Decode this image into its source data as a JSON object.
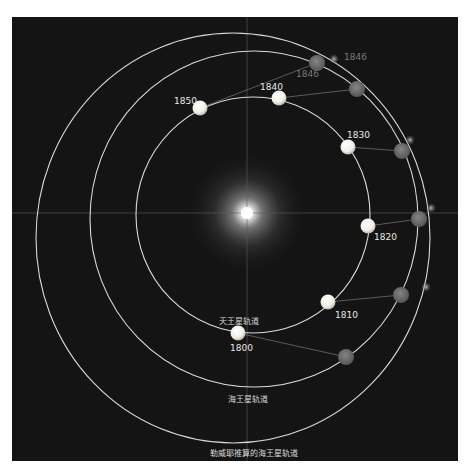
{
  "diagram": {
    "orbit_labels": {
      "uranus": "天王星轨道",
      "neptune": "海王星轨道",
      "leverrier": "勒威耶推算的海王星轨道"
    },
    "uranus_years": [
      "1800",
      "1810",
      "1820",
      "1830",
      "1840",
      "1850"
    ],
    "predicted_labels": [
      "1846",
      "1846"
    ],
    "colors": {
      "background": "#141414",
      "orbit_line": "#d9d9d9",
      "uranus": "#f4f4ee",
      "neptune": "#6e6e6e",
      "predicted": "#9a9a9a",
      "sun": "#ffffff"
    }
  }
}
